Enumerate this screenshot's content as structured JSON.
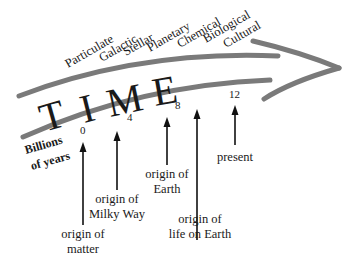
{
  "diagram": {
    "title_letters": [
      "T",
      "I",
      "M",
      "E"
    ],
    "categories": [
      "Particulate",
      "Galactic",
      "Stellar",
      "Planetary",
      "Chemical",
      "Biological",
      "Cultural"
    ],
    "axis_label": [
      "Billions",
      "of years"
    ],
    "ticks": [
      "0",
      "4",
      "8",
      "12"
    ],
    "events": [
      {
        "lines": [
          "origin of",
          "matter"
        ]
      },
      {
        "lines": [
          "origin of",
          "Milky Way"
        ]
      },
      {
        "lines": [
          "origin of",
          "Earth"
        ]
      },
      {
        "lines": [
          "origin of",
          "life on Earth"
        ]
      },
      {
        "lines": [
          "present"
        ]
      }
    ],
    "colors": {
      "band": "#7a7a7a",
      "text": "#1a1a1a"
    }
  }
}
